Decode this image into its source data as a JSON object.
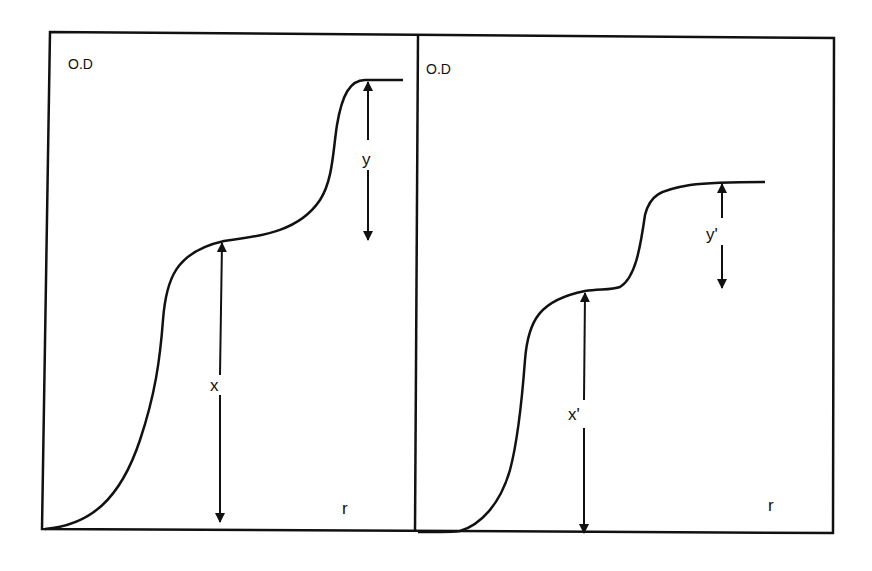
{
  "diagram": {
    "type": "two-panel schematic: stepwise O.D vs r sedimentation boundary profiles",
    "stroke_color": "#111111",
    "background": "#ffffff",
    "panels": [
      {
        "id": "left",
        "y_axis_label": "O.D",
        "x_axis_label": "r",
        "lower_step_label": "x",
        "upper_step_label": "y"
      },
      {
        "id": "right",
        "y_axis_label": "O.D",
        "x_axis_label": "r",
        "lower_step_label": "x'",
        "upper_step_label": "y'"
      }
    ]
  }
}
